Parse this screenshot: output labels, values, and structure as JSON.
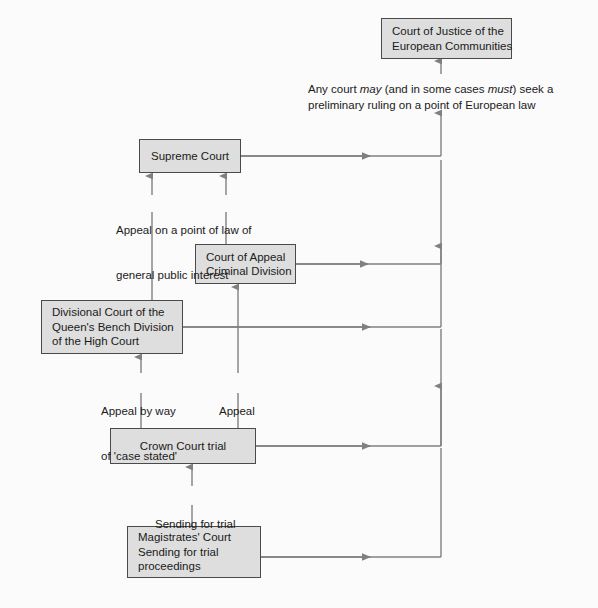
{
  "diagram": {
    "style": {
      "box_fill": "#dedede",
      "box_border": "#4a4a4a",
      "line_color": "#808080",
      "text_color": "#1a1a1a",
      "background": "#fbfbfb"
    },
    "nodes": [
      {
        "id": "cjec",
        "lines": [
          "Court of Justice of the",
          "European Communities"
        ],
        "x": 381,
        "y": 18,
        "w": 131,
        "h": 41
      },
      {
        "id": "supreme-court",
        "lines": [
          "Supreme Court"
        ],
        "x": 139,
        "y": 139,
        "w": 102,
        "h": 34
      },
      {
        "id": "court-of-appeal",
        "lines": [
          "Court of Appeal",
          "Criminal Division"
        ],
        "x": 195,
        "y": 244,
        "w": 101,
        "h": 40
      },
      {
        "id": "divisional-court",
        "lines": [
          "Divisional Court of the",
          "Queen's Bench Division",
          "of the High Court"
        ],
        "x": 41,
        "y": 300,
        "w": 142,
        "h": 54
      },
      {
        "id": "crown-court",
        "lines": [
          "Crown Court trial"
        ],
        "x": 110,
        "y": 428,
        "w": 146,
        "h": 36
      },
      {
        "id": "magistrates-court",
        "lines": [
          "Magistrates' Court",
          "Sending for trial",
          "proceedings"
        ],
        "x": 127,
        "y": 526,
        "w": 134,
        "h": 52
      }
    ],
    "edge_labels": [
      {
        "id": "appeal-point-of-law",
        "lines": [
          "Appeal on a point of law of",
          "general public interest"
        ],
        "x": 116,
        "y": 193
      },
      {
        "id": "appeal-case-stated",
        "lines": [
          "Appeal by way",
          "of 'case stated'"
        ],
        "x": 101,
        "y": 374
      },
      {
        "id": "appeal",
        "lines": [
          "Appeal"
        ],
        "x": 219,
        "y": 374
      },
      {
        "id": "sending-for-trial",
        "lines": [
          "Sending for trial"
        ],
        "x": 155,
        "y": 487
      }
    ],
    "ruling_note": {
      "line1_before": "Any court ",
      "line1_italic1": "may",
      "line1_middle": " (and in some cases ",
      "line1_italic2": "must",
      "line1_after": ") seek a",
      "line2": "preliminary ruling on a point of European law",
      "x": 308,
      "y": 82
    }
  }
}
